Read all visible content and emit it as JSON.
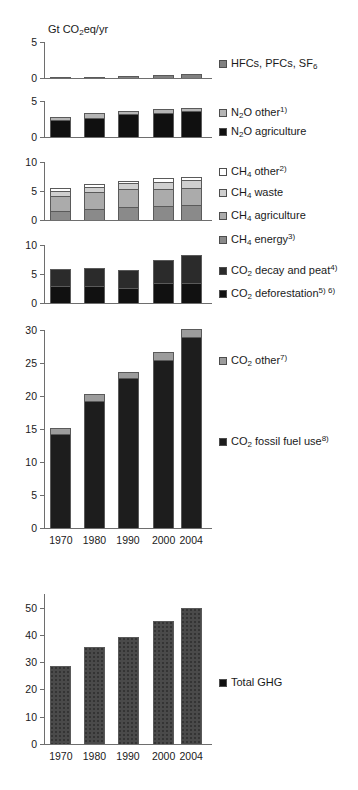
{
  "figure": {
    "axis_title": "Gt CO₂eq/yr",
    "categories": [
      "1970",
      "1980",
      "1990",
      "2000",
      "2004"
    ]
  },
  "chart_data": {
    "type": "bar",
    "title": "Gt CO2eq/yr",
    "subtitle": "Global anthropogenic greenhouse gas emissions by gas and source",
    "xlabel": "",
    "ylabel": "Gt CO2eq/yr",
    "grid": false,
    "legend_position": "right",
    "categories": [
      "1970",
      "1980",
      "1990",
      "2000",
      "2004"
    ],
    "panels": [
      {
        "id": "hfcs",
        "ylim": [
          0,
          5
        ],
        "yticks": [
          0,
          5
        ],
        "stacked": true,
        "series": [
          {
            "name": "HFCs, PFCs, SF6",
            "color": "#808080",
            "values": [
              0.1,
              0.2,
              0.25,
              0.4,
              0.5
            ]
          }
        ]
      },
      {
        "id": "n2o",
        "ylim": [
          0,
          5
        ],
        "yticks": [
          0,
          5
        ],
        "stacked": true,
        "series": [
          {
            "name": "N2O agriculture",
            "color": "#101010",
            "values": [
              2.3,
              2.7,
              3.2,
              3.4,
              3.6
            ]
          },
          {
            "name": "N2O other",
            "color": "#b5b5b5",
            "values": [
              0.5,
              0.6,
              0.45,
              0.5,
              0.5
            ]
          }
        ]
      },
      {
        "id": "ch4",
        "ylim": [
          0,
          10
        ],
        "yticks": [
          0,
          5,
          10
        ],
        "stacked": true,
        "series": [
          {
            "name": "CH4 energy",
            "color": "#8a8a8a",
            "values": [
              1.5,
              1.9,
              2.3,
              2.4,
              2.6
            ]
          },
          {
            "name": "CH4 agriculture",
            "color": "#ababab",
            "values": [
              2.7,
              2.9,
              3.0,
              2.9,
              2.9
            ]
          },
          {
            "name": "CH4 waste",
            "color": "#cfcfcf",
            "values": [
              0.85,
              0.95,
              1.0,
              1.3,
              1.4
            ]
          },
          {
            "name": "CH4 other",
            "color": "#ffffff",
            "values": [
              0.4,
              0.4,
              0.45,
              0.6,
              0.6
            ]
          }
        ]
      },
      {
        "id": "co2-land",
        "ylim": [
          0,
          10
        ],
        "yticks": [
          0,
          5,
          10
        ],
        "stacked": true,
        "series": [
          {
            "name": "CO2 deforestation",
            "color": "#111111",
            "values": [
              2.9,
              3.0,
              2.6,
              3.4,
              3.4
            ]
          },
          {
            "name": "CO2 decay and peat",
            "color": "#2b2b2b",
            "values": [
              2.95,
              3.0,
              3.05,
              4.1,
              4.8
            ]
          }
        ]
      },
      {
        "id": "co2-fossil",
        "ylim": [
          0,
          30
        ],
        "yticks": [
          0,
          5,
          10,
          15,
          20,
          25,
          30
        ],
        "stacked": true,
        "show_xlabels": true,
        "series": [
          {
            "name": "CO2 fossil fuel use",
            "color": "#1d1d1d",
            "values": [
              14.3,
              19.3,
              22.8,
              25.5,
              29.0
            ]
          },
          {
            "name": "CO2 other",
            "color": "#9c9c9c",
            "values": [
              0.9,
              1.0,
              0.8,
              1.1,
              1.2
            ]
          }
        ]
      },
      {
        "id": "total",
        "ylim": [
          0,
          55
        ],
        "yticks": [
          0,
          10,
          20,
          30,
          40,
          50
        ],
        "stacked": false,
        "show_xlabels": true,
        "series": [
          {
            "name": "Total GHG",
            "color": "#4a4a4a",
            "values": [
              28.7,
              35.4,
              39.2,
              45.0,
              49.8
            ]
          }
        ]
      }
    ],
    "legend": [
      {
        "label": "HFCs, PFCs, SF6",
        "html": "HFCs, PFCs, SF<sub>6</sub>",
        "color": "#808080"
      },
      {
        "label": "N2O other 1)",
        "html": "N<sub>2</sub>O other<sup>1)</sup>",
        "color": "#b5b5b5"
      },
      {
        "label": "N2O agriculture",
        "html": "N<sub>2</sub>O agriculture",
        "color": "#101010"
      },
      {
        "label": "CH4 other 2)",
        "html": "CH<sub>4</sub> other<sup>2)</sup>",
        "color": "#ffffff"
      },
      {
        "label": "CH4 waste",
        "html": "CH<sub>4</sub> waste",
        "color": "#cfcfcf"
      },
      {
        "label": "CH4 agriculture",
        "html": "CH<sub>4</sub> agriculture",
        "color": "#ababab"
      },
      {
        "label": "CH4 energy 3)",
        "html": "CH<sub>4</sub> energy<sup>3)</sup>",
        "color": "#8a8a8a"
      },
      {
        "label": "CO2 decay and peat 4)",
        "html": "CO<sub>2</sub> decay and peat<sup>4)</sup>",
        "color": "#2b2b2b"
      },
      {
        "label": "CO2 deforestation 5) 6)",
        "html": "CO<sub>2</sub> deforestation<sup>5) 6)</sup>",
        "color": "#111111"
      },
      {
        "label": "CO2 other 7)",
        "html": "CO<sub>2</sub> other<sup>7)</sup>",
        "color": "#9c9c9c"
      },
      {
        "label": "CO2 fossil fuel use 8)",
        "html": "CO<sub>2</sub> fossil fuel use<sup>8)</sup>",
        "color": "#1d1d1d"
      },
      {
        "label": "Total GHG",
        "html": "Total GHG",
        "color": "#101010"
      }
    ]
  }
}
